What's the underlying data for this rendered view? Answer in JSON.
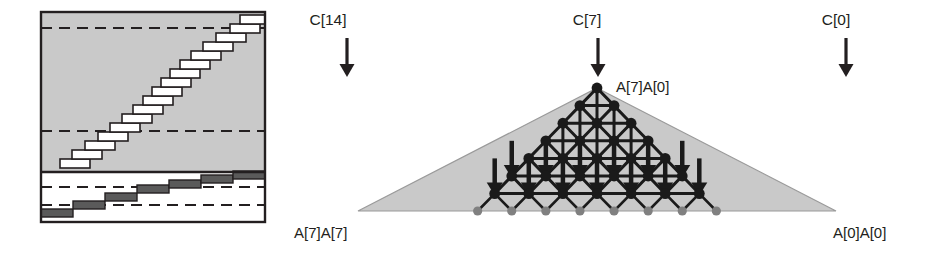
{
  "figure": {
    "title": "",
    "left_panel": {
      "name": "staircase-plot",
      "frame": {
        "x": 41,
        "y": 12,
        "w": 224,
        "h": 210
      },
      "upper_region_fill": "#c9c9c9",
      "lower_region_fill": "#ffffff",
      "upper_stair_fill": "#ffffff",
      "lower_stair_fill": "#5a5a5a",
      "border_color": "#231f20",
      "divider_y": 172,
      "dashed_lines_y": [
        28,
        131,
        187,
        205
      ],
      "upper_steps": [
        {
          "x": 60,
          "y": 159,
          "w": 30,
          "h": 9
        },
        {
          "x": 72,
          "y": 150,
          "w": 30,
          "h": 9
        },
        {
          "x": 85,
          "y": 141,
          "w": 30,
          "h": 9
        },
        {
          "x": 98,
          "y": 132,
          "w": 30,
          "h": 9
        },
        {
          "x": 110,
          "y": 123,
          "w": 30,
          "h": 9
        },
        {
          "x": 122,
          "y": 114,
          "w": 30,
          "h": 9
        },
        {
          "x": 133,
          "y": 105,
          "w": 30,
          "h": 9
        },
        {
          "x": 143,
          "y": 96,
          "w": 30,
          "h": 9
        },
        {
          "x": 152,
          "y": 87,
          "w": 30,
          "h": 9
        },
        {
          "x": 161,
          "y": 78,
          "w": 30,
          "h": 9
        },
        {
          "x": 170,
          "y": 69,
          "w": 30,
          "h": 9
        },
        {
          "x": 180,
          "y": 60,
          "w": 30,
          "h": 9
        },
        {
          "x": 191,
          "y": 51,
          "w": 30,
          "h": 9
        },
        {
          "x": 203,
          "y": 42,
          "w": 30,
          "h": 9
        },
        {
          "x": 216,
          "y": 33,
          "w": 30,
          "h": 9
        },
        {
          "x": 230,
          "y": 24,
          "w": 30,
          "h": 9
        },
        {
          "x": 240,
          "y": 15,
          "w": 25,
          "h": 9
        }
      ],
      "lower_steps": [
        {
          "x": 41,
          "y": 209,
          "w": 32,
          "h": 8
        },
        {
          "x": 73,
          "y": 201,
          "w": 32,
          "h": 8
        },
        {
          "x": 105,
          "y": 193,
          "w": 32,
          "h": 8
        },
        {
          "x": 137,
          "y": 185,
          "w": 32,
          "h": 8
        },
        {
          "x": 169,
          "y": 180,
          "w": 32,
          "h": 8
        },
        {
          "x": 201,
          "y": 175,
          "w": 32,
          "h": 8
        },
        {
          "x": 233,
          "y": 171,
          "w": 32,
          "h": 8
        }
      ]
    },
    "right_panel": {
      "name": "triangular-lattice-diagram",
      "shade_fill": "#c9c9c9",
      "node_color": "#1a1a1a",
      "base_node_color": "#808080",
      "edge_color": "#1a1a1a",
      "apex": {
        "x": 597,
        "y": 88
      },
      "base_left": {
        "x": 358,
        "y": 211
      },
      "base_right": {
        "x": 836,
        "y": 211
      },
      "rows": 7,
      "column_spacing": 34.1,
      "row_spacing": 17.6,
      "arrow_count": 9,
      "labels": {
        "apex": "A[7]A[0]",
        "bottom_left": "A[7]A[7]",
        "bottom_right": "A[0]A[0]"
      },
      "top_pointers": [
        {
          "label": "C[14]",
          "label_x": 328,
          "label_y": 20,
          "arrow_x": 347,
          "arrow_y0": 38,
          "arrow_y1": 76
        },
        {
          "label": "C[7]",
          "label_x": 587,
          "label_y": 20,
          "arrow_x": 598,
          "arrow_y0": 38,
          "arrow_y1": 76
        },
        {
          "label": "C[0]",
          "label_x": 836,
          "label_y": 20,
          "arrow_x": 846,
          "arrow_y0": 38,
          "arrow_y1": 76
        }
      ]
    }
  }
}
